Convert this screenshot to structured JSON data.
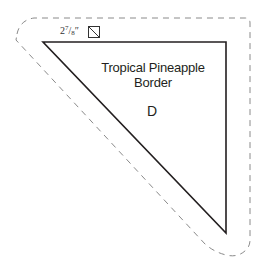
{
  "pattern": {
    "title_line1": "Tropical Pineapple",
    "title_line2": "Border",
    "piece_letter": "D"
  },
  "cut_size": {
    "whole": "2",
    "numerator": "7",
    "slash": "/",
    "denominator": "8",
    "unit": "″",
    "icon": "half-square-triangle-cut-icon"
  },
  "colors": {
    "cut_line": "#231f20",
    "seam_allowance_dash": "#808080",
    "background": "#ffffff"
  }
}
